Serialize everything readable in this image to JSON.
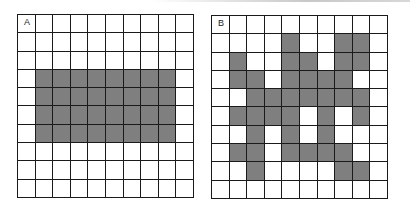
{
  "figure": {
    "panels": [
      {
        "id": "A",
        "label": "A",
        "rows": 10,
        "cols": 10,
        "shaded_color": "#7f7f7f",
        "shaded": [
          [
            0,
            0,
            0,
            0,
            0,
            0,
            0,
            0,
            0,
            0
          ],
          [
            0,
            0,
            0,
            0,
            0,
            0,
            0,
            0,
            0,
            0
          ],
          [
            0,
            0,
            0,
            0,
            0,
            0,
            0,
            0,
            0,
            0
          ],
          [
            0,
            1,
            1,
            1,
            1,
            1,
            1,
            1,
            1,
            0
          ],
          [
            0,
            1,
            1,
            1,
            1,
            1,
            1,
            1,
            1,
            0
          ],
          [
            0,
            1,
            1,
            1,
            1,
            1,
            1,
            1,
            1,
            0
          ],
          [
            0,
            1,
            1,
            1,
            1,
            1,
            1,
            1,
            1,
            0
          ],
          [
            0,
            0,
            0,
            0,
            0,
            0,
            0,
            0,
            0,
            0
          ],
          [
            0,
            0,
            0,
            0,
            0,
            0,
            0,
            0,
            0,
            0
          ],
          [
            0,
            0,
            0,
            0,
            0,
            0,
            0,
            0,
            0,
            0
          ]
        ]
      },
      {
        "id": "B",
        "label": "B",
        "rows": 10,
        "cols": 10,
        "shaded_color": "#7f7f7f",
        "shaded": [
          [
            0,
            0,
            0,
            0,
            0,
            0,
            0,
            0,
            0,
            0
          ],
          [
            0,
            0,
            0,
            0,
            1,
            0,
            0,
            1,
            1,
            0
          ],
          [
            0,
            1,
            0,
            0,
            1,
            1,
            0,
            1,
            1,
            0
          ],
          [
            0,
            1,
            1,
            0,
            1,
            1,
            1,
            1,
            0,
            0
          ],
          [
            0,
            0,
            1,
            1,
            1,
            1,
            1,
            1,
            1,
            0
          ],
          [
            0,
            1,
            1,
            1,
            1,
            0,
            1,
            0,
            1,
            0
          ],
          [
            0,
            0,
            1,
            0,
            1,
            0,
            1,
            0,
            0,
            0
          ],
          [
            0,
            1,
            1,
            0,
            1,
            1,
            1,
            1,
            0,
            0
          ],
          [
            0,
            0,
            1,
            0,
            0,
            0,
            0,
            1,
            1,
            0
          ],
          [
            0,
            0,
            0,
            0,
            0,
            0,
            0,
            0,
            0,
            0
          ]
        ]
      }
    ]
  }
}
